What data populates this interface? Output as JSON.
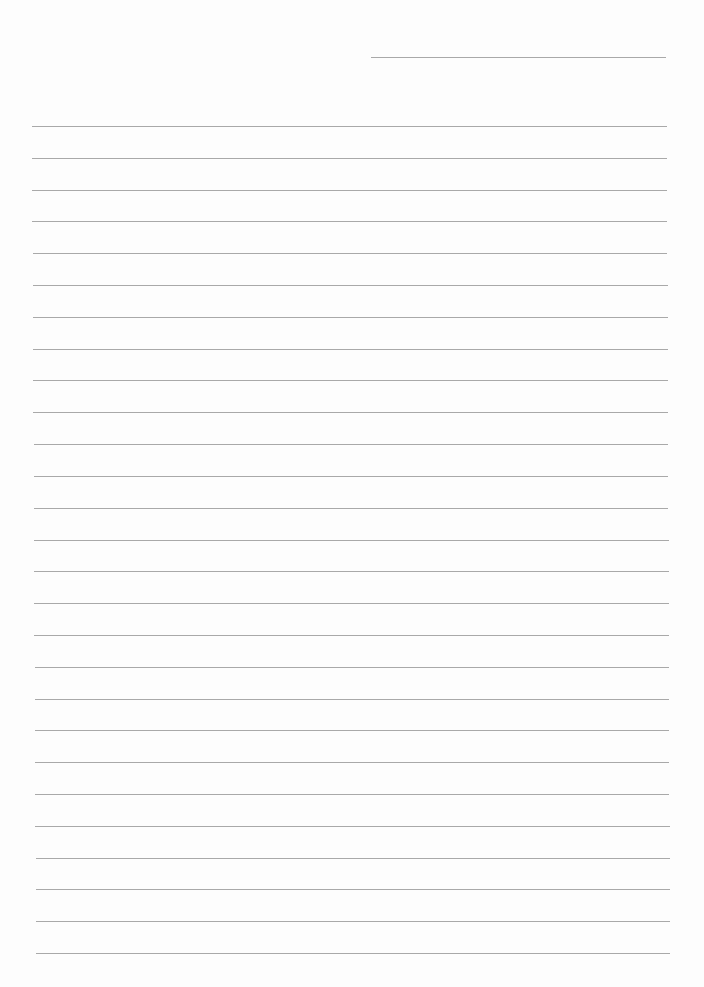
{
  "page": {
    "type": "blank lined paper",
    "background": "#fdfdfd",
    "line_color": "#9a9a9a",
    "header_line": {
      "x1": 371,
      "x2": 666,
      "y": 57
    },
    "lines": {
      "count": 27,
      "first_y": 126,
      "last_y": 953,
      "x_start_top": 32,
      "x_start_bottom": 36,
      "x_end_top": 667,
      "x_end_bottom": 670
    }
  }
}
